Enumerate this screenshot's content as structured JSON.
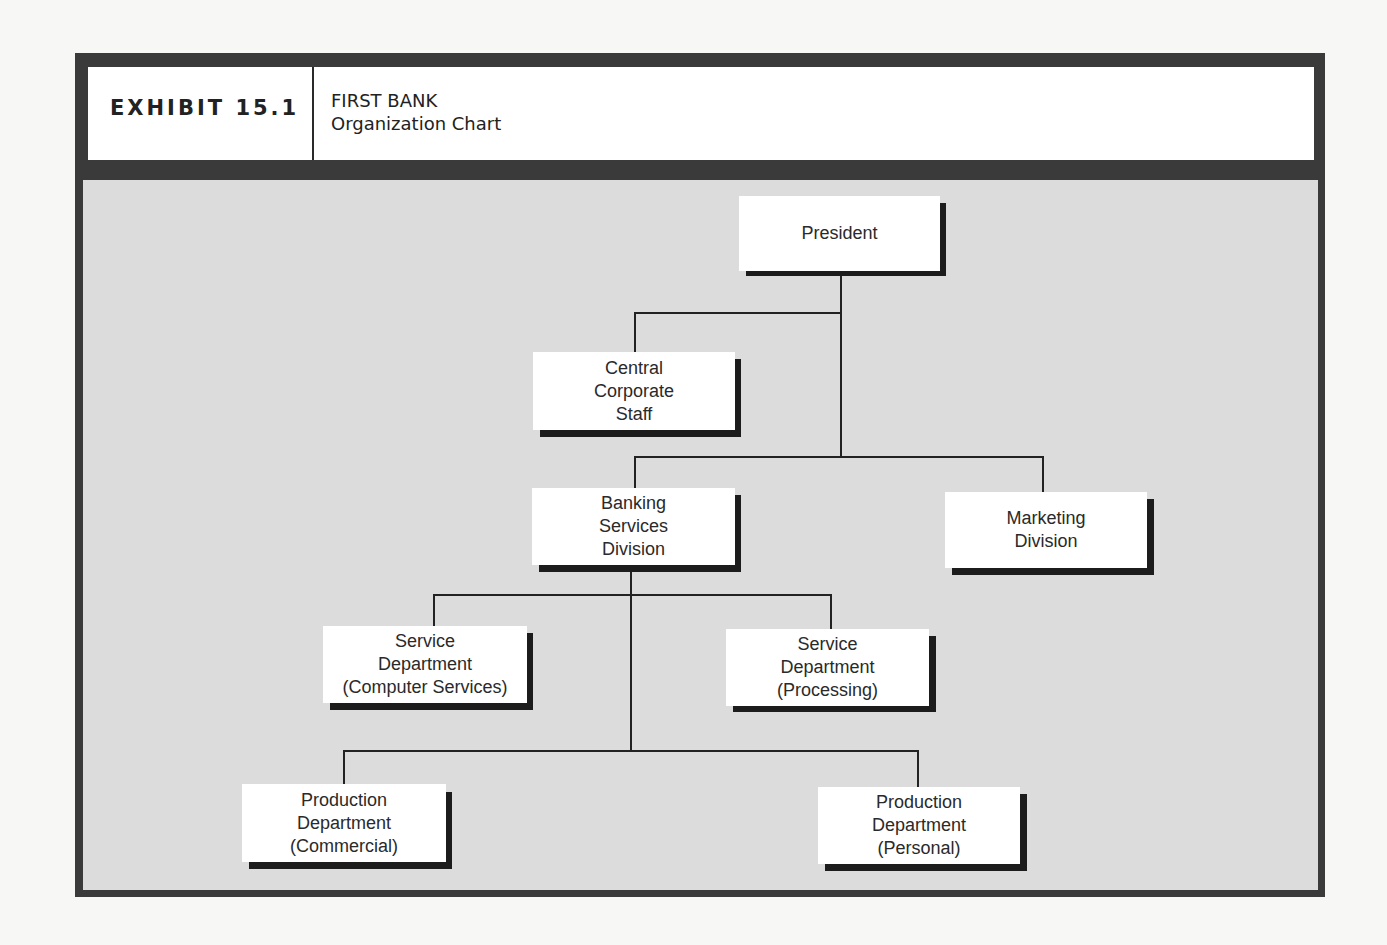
{
  "header": {
    "exhibit_label": "EXHIBIT 15.1",
    "title_line1": "FIRST BANK",
    "title_line2": "Organization Chart"
  },
  "colors": {
    "frame": "#3a3a3a",
    "chart_background": "#dcdcdc",
    "box_fill": "#ffffff",
    "box_shadow": "#1c1c1c",
    "connector": "#222222"
  },
  "org_chart": {
    "nodes": [
      {
        "id": "president",
        "lines": [
          "President"
        ],
        "parent": null
      },
      {
        "id": "central-corporate-staff",
        "lines": [
          "Central",
          "Corporate",
          "Staff"
        ],
        "parent": "president"
      },
      {
        "id": "banking-services-division",
        "lines": [
          "Banking",
          "Services",
          "Division"
        ],
        "parent": "president"
      },
      {
        "id": "marketing-division",
        "lines": [
          "Marketing",
          "Division"
        ],
        "parent": "president"
      },
      {
        "id": "service-dept-computer",
        "lines": [
          "Service",
          "Department",
          "(Computer Services)"
        ],
        "parent": "banking-services-division"
      },
      {
        "id": "service-dept-processing",
        "lines": [
          "Service",
          "Department",
          "(Processing)"
        ],
        "parent": "banking-services-division"
      },
      {
        "id": "production-dept-commercial",
        "lines": [
          "Production",
          "Department",
          "(Commercial)"
        ],
        "parent": "banking-services-division"
      },
      {
        "id": "production-dept-personal",
        "lines": [
          "Production",
          "Department",
          "(Personal)"
        ],
        "parent": "banking-services-division"
      }
    ]
  }
}
